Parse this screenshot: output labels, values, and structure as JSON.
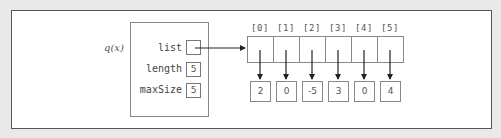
{
  "diagram": {
    "variable_name": "q(x)",
    "struct": {
      "fields": [
        {
          "name": "list",
          "value": "",
          "type": "pointer"
        },
        {
          "name": "length",
          "value": "5"
        },
        {
          "name": "maxSize",
          "value": "5"
        }
      ]
    },
    "array": {
      "indices": [
        "[0]",
        "[1]",
        "[2]",
        "[3]",
        "[4]",
        "[5]"
      ],
      "values": [
        "2",
        "0",
        "-5",
        "3",
        "0",
        "4"
      ]
    },
    "colors": {
      "background": "#e9e9e9",
      "frame": "#ffffff",
      "border": "#888888",
      "arrow": "#222222"
    }
  }
}
